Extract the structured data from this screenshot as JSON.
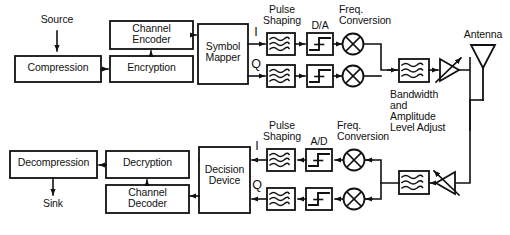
{
  "diagram": {
    "stroke_color": "#111111",
    "fill_color": "#ffffff",
    "transmit_chain": {
      "source_label": "Source",
      "blocks": [
        {
          "id": "compression",
          "label": "Compression"
        },
        {
          "id": "encryption",
          "label": "Encryption"
        },
        {
          "id": "channel-encoder",
          "label": "Channel\nEncoder"
        },
        {
          "id": "symbol-mapper",
          "label": "Symbol\nMapper"
        }
      ],
      "branch_labels": {
        "i": "I",
        "q": "Q"
      },
      "stage_labels": {
        "pulse_shaping": "Pulse\nShaping",
        "converter": "D/A",
        "freq_conversion": "Freq.\nConversion"
      },
      "amplifier_label": "Bandwidth\nand\nAmplitude\nLevel Adjust",
      "antenna_label": "Antenna",
      "icons": {
        "filter": "lowpass-filter-icon",
        "converter": "step-function-icon",
        "mixer": "mixer-x-icon",
        "amplifier": "variable-gain-amplifier-icon",
        "antenna": "antenna-icon"
      }
    },
    "receive_chain": {
      "sink_label": "Sink",
      "blocks": [
        {
          "id": "decompression",
          "label": "Decompression"
        },
        {
          "id": "decryption",
          "label": "Decryption"
        },
        {
          "id": "channel-decoder",
          "label": "Channel\nDecoder"
        },
        {
          "id": "decision-device",
          "label": "Decision\nDevice"
        }
      ],
      "branch_labels": {
        "i": "I",
        "q": "Q"
      },
      "stage_labels": {
        "pulse_shaping": "Pulse\nShaping",
        "converter": "A/D",
        "freq_conversion": "Freq.\nConversion"
      },
      "icons": {
        "filter": "lowpass-filter-icon",
        "converter": "step-function-icon",
        "mixer": "mixer-x-icon",
        "amplifier": "low-noise-amplifier-icon"
      }
    }
  }
}
